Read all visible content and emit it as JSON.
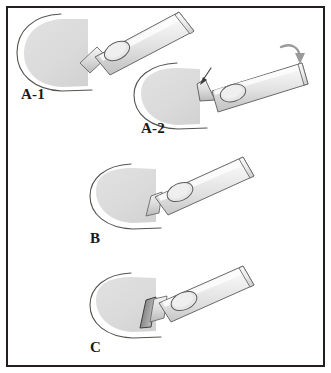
{
  "figure": {
    "background_color": "#ffffff",
    "frame_color": "#231f20",
    "panel_count": 4
  },
  "palette": {
    "blade_fill": "#d9d9d9",
    "blade_fill_light": "#e3e3e3",
    "handle_fill": "#e8e8e8",
    "handle_shade": "#c9c9c9",
    "handle_highlight": "#f6f6f6",
    "outline": "#4a4a4a",
    "outline_dark": "#3a3a3a",
    "tip_dark": "#8e8e8e",
    "arrow_fill": "#9a9a9a",
    "label_color": "#1a1a1a"
  },
  "panels": [
    {
      "id": "a-1",
      "label": "A-1",
      "label_x": 21,
      "label_y": 99,
      "description": "Blade fully seated on handle, instrument assembled",
      "blade_present": true,
      "handle_detached": false,
      "tip_dark": false,
      "arrows": []
    },
    {
      "id": "a-2",
      "label": "A-2",
      "label_x": 141,
      "label_y": 133,
      "description": "Handle being pressed down onto blade, blade partially separated",
      "blade_present": true,
      "handle_detached": true,
      "tip_dark": false,
      "arrows": [
        {
          "name": "pointer-arrow",
          "kind": "straight",
          "target": "blade-handle-junction"
        },
        {
          "name": "press-down-arrow",
          "kind": "curved",
          "target": "handle-end"
        }
      ]
    },
    {
      "id": "b",
      "label": "B",
      "label_x": 90,
      "label_y": 243,
      "description": "Blade engaged on handle shaft, mid seating",
      "blade_present": true,
      "handle_detached": false,
      "tip_dark": false,
      "arrows": []
    },
    {
      "id": "c",
      "label": "C",
      "label_x": 90,
      "label_y": 352,
      "description": "Blade fully locked with dark bevelled cutting edge exposed",
      "blade_present": true,
      "handle_detached": false,
      "tip_dark": true,
      "arrows": []
    }
  ],
  "instrument": {
    "name": "scalpel",
    "parts": [
      {
        "name": "blade",
        "shape": "half-disc"
      },
      {
        "name": "blade-outline-arc",
        "shape": "open-arc"
      },
      {
        "name": "handle",
        "shape": "tapered-bar"
      },
      {
        "name": "handle-oval-hole",
        "shape": "oval"
      },
      {
        "name": "handle-end",
        "shape": "angled-cut"
      }
    ]
  }
}
